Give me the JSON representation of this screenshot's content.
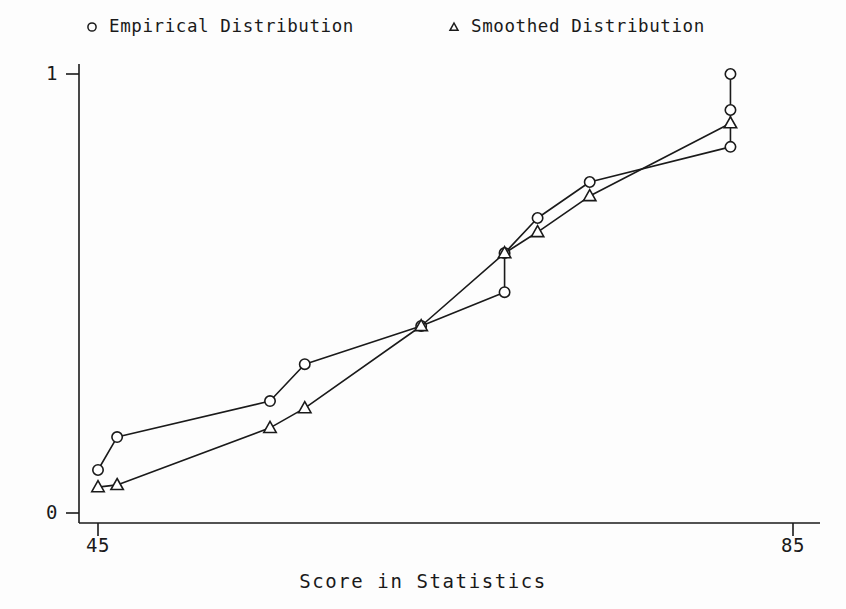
{
  "chart_data": {
    "type": "line",
    "title": "",
    "subtitle": "",
    "xlabel": "Score in Statistics",
    "ylabel": "",
    "xlim": [
      43.0,
      86.0
    ],
    "ylim": [
      -0.03,
      1.06
    ],
    "xticks": [
      45,
      85
    ],
    "xtick_labels": [
      "45",
      "85"
    ],
    "yticks": [
      0,
      1
    ],
    "ytick_labels": [
      "0",
      "1"
    ],
    "grid": false,
    "legend_position": "top",
    "annotations": [],
    "series": [
      {
        "name": "Empirical Distribution",
        "marker": "circle",
        "marker_filled": false,
        "color": "#1a1a1a",
        "x": [
          45.0,
          46.1,
          54.9,
          56.9,
          63.6,
          68.4,
          68.4,
          70.3,
          73.3,
          81.4,
          81.4,
          81.4
        ],
        "y": [
          0.098,
          0.173,
          0.255,
          0.339,
          0.426,
          0.503,
          0.592,
          0.672,
          0.754,
          0.834,
          0.918,
          1.0
        ]
      },
      {
        "name": "Smoothed Distribution",
        "marker": "triangle",
        "marker_filled": false,
        "color": "#1a1a1a",
        "x": [
          45.0,
          46.1,
          54.9,
          56.9,
          63.6,
          68.4,
          70.3,
          73.3,
          81.4
        ],
        "y": [
          0.059,
          0.064,
          0.194,
          0.239,
          0.426,
          0.592,
          0.64,
          0.722,
          0.888
        ]
      }
    ]
  },
  "legend": {
    "entries": [
      {
        "label": "Empirical Distribution",
        "marker": "circle"
      },
      {
        "label": "Smoothed Distribution",
        "marker": "triangle"
      }
    ]
  },
  "axes": {
    "x_title": "Score in Statistics",
    "x_tick_min": "45",
    "x_tick_max": "85",
    "y_tick_min": "0",
    "y_tick_max": "1"
  },
  "colors": {
    "ink": "#1a1a1a",
    "background": "#fdfdfd"
  }
}
